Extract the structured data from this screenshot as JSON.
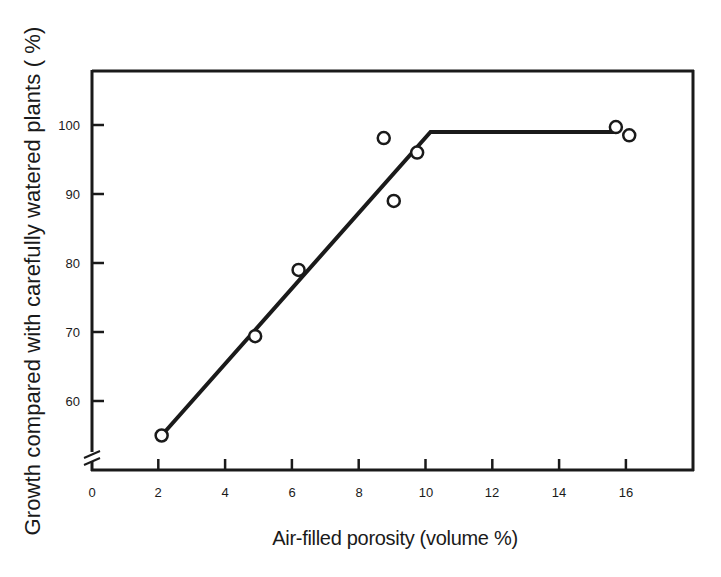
{
  "chart_data": {
    "type": "scatter",
    "title": "",
    "xlabel": "Air-filled porosity (volume %)",
    "ylabel": "Growth compared with carefully watered plants ( %)",
    "xlim": [
      0,
      18
    ],
    "ylim": [
      52,
      110
    ],
    "x_ticks": [
      0,
      2,
      4,
      6,
      8,
      10,
      12,
      14,
      16
    ],
    "y_ticks": [
      60,
      70,
      80,
      90,
      100
    ],
    "y_axis_break": true,
    "grid": false,
    "legend": null,
    "series": [
      {
        "name": "observations",
        "marker": "open-circle",
        "points": [
          {
            "x": 2.1,
            "y": 55.0
          },
          {
            "x": 4.9,
            "y": 69.4
          },
          {
            "x": 6.2,
            "y": 79.0
          },
          {
            "x": 8.75,
            "y": 98.1
          },
          {
            "x": 9.05,
            "y": 89.0
          },
          {
            "x": 9.75,
            "y": 96.0
          },
          {
            "x": 15.7,
            "y": 99.7
          },
          {
            "x": 16.1,
            "y": 98.5
          }
        ]
      },
      {
        "name": "fitted line",
        "style": "solid-thick",
        "points": [
          {
            "x": 2.1,
            "y": 55.0
          },
          {
            "x": 10.15,
            "y": 99.0
          },
          {
            "x": 15.75,
            "y": 99.0
          }
        ]
      }
    ]
  },
  "labels": {
    "xlabel": "Air-filled porosity (volume %)",
    "ylabel": "Growth compared with carefully watered plants ( %)",
    "x_ticks": [
      "0",
      "2",
      "4",
      "6",
      "8",
      "10",
      "12",
      "14",
      "16"
    ],
    "y_ticks": [
      "100",
      "90",
      "80",
      "70",
      "60"
    ]
  },
  "colors": {
    "ink": "#1a1a1a",
    "background": "#ffffff"
  }
}
